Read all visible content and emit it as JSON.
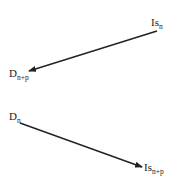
{
  "diagram": {
    "nodes": [
      {
        "id": "is_n",
        "base": "Is",
        "subscript": "n"
      },
      {
        "id": "d_n_plus_p",
        "base": "D",
        "subscript": "n+p"
      },
      {
        "id": "d_n",
        "base": "D",
        "subscript": "n"
      },
      {
        "id": "is_n_plus_p",
        "base": "Is",
        "subscript": "n+p"
      }
    ],
    "edges": [
      {
        "from": "is_n",
        "to": "d_n_plus_p"
      },
      {
        "from": "d_n",
        "to": "is_n_plus_p"
      }
    ],
    "colors": {
      "ink": "#222222",
      "background": "#ffffff"
    }
  }
}
